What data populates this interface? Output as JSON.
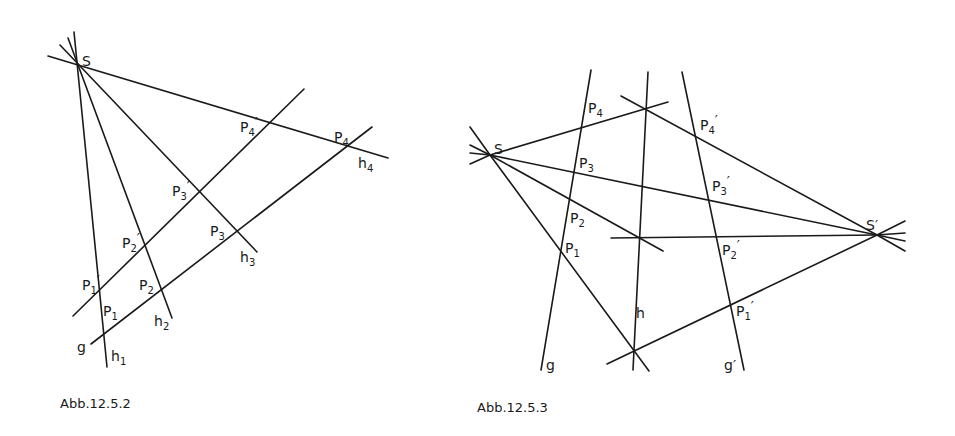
{
  "figures": [
    {
      "caption": "Abb.12.5.2",
      "labels": {
        "S": "S",
        "P1p": "P",
        "P1p_sub": "1",
        "P1p_prime": "′",
        "P2p": "P",
        "P2p_sub": "2",
        "P2p_prime": "′",
        "P3p": "P",
        "P3p_sub": "3",
        "P3p_prime": "′",
        "P4p": "P",
        "P4p_sub": "4",
        "P4p_prime": "′",
        "P1": "P",
        "P1_sub": "1",
        "P2": "P",
        "P2_sub": "2",
        "P3": "P",
        "P3_sub": "3",
        "P4": "P",
        "P4_sub": "4",
        "g": "g",
        "h1": "h",
        "h1_sub": "1",
        "h2": "h",
        "h2_sub": "2",
        "h3": "h",
        "h3_sub": "3",
        "h4": "h",
        "h4_sub": "4"
      }
    },
    {
      "caption": "Abb.12.5.3",
      "labels": {
        "S": "S",
        "Sp": "S′",
        "P1": "P",
        "P1_sub": "1",
        "P2": "P",
        "P2_sub": "2",
        "P3": "P",
        "P3_sub": "3",
        "P4": "P",
        "P4_sub": "4",
        "P1p": "P",
        "P1p_sub": "1",
        "P1p_prime": "′",
        "P2p": "P",
        "P2p_sub": "2",
        "P2p_prime": "′",
        "P3p": "P",
        "P3p_sub": "3",
        "P3p_prime": "′",
        "P4p": "P",
        "P4p_sub": "4",
        "P4p_prime": "′",
        "g": "g",
        "gp": "g′",
        "h": "h"
      }
    }
  ]
}
